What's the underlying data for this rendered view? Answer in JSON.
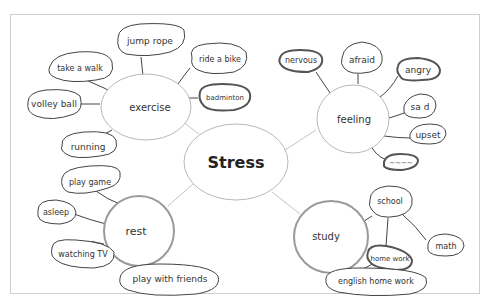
{
  "diagram": {
    "type": "mind-map",
    "style": "hand-drawn",
    "colors": {
      "paper": "#ffffff",
      "border": "#cfcfcf",
      "ink": "#333333",
      "thick_ink": "#555555",
      "center_line": "#bdbdbd"
    },
    "center": {
      "label": "Stress"
    },
    "branches": [
      {
        "label": "exercise",
        "items": [
          "jump rope",
          "take a walk",
          "ride a bike",
          "volley ball",
          "badminton",
          "running"
        ]
      },
      {
        "label": "feeling",
        "items": [
          "nervous",
          "afraid",
          "angry",
          "sad",
          "upset",
          "(scribbled out)"
        ]
      },
      {
        "label": "rest",
        "items": [
          "play game",
          "asleep",
          "watching TV",
          "play with friends"
        ]
      },
      {
        "label": "study",
        "items": [
          "school",
          "math",
          "home work",
          "english home work"
        ]
      }
    ]
  },
  "labels": {
    "center": "Stress",
    "exercise": "exercise",
    "feeling": "feeling",
    "rest": "rest",
    "study": "study",
    "jump_rope": "jump rope",
    "take_a_walk": "take a walk",
    "ride_a_bike": "ride a bike",
    "volley_ball": "volley ball",
    "badminton": "badminton",
    "running": "running",
    "nervous": "nervous",
    "afraid": "afraid",
    "angry": "angry",
    "sad": "sa d",
    "upset": "upset",
    "scribbled": "~~~~",
    "play_game": "play game",
    "asleep": "asleep",
    "watching_tv": "watching TV",
    "play_with_friends": "play with friends",
    "school": "school",
    "math": "math",
    "home_work": "home work",
    "english_home_work": "english home work"
  }
}
